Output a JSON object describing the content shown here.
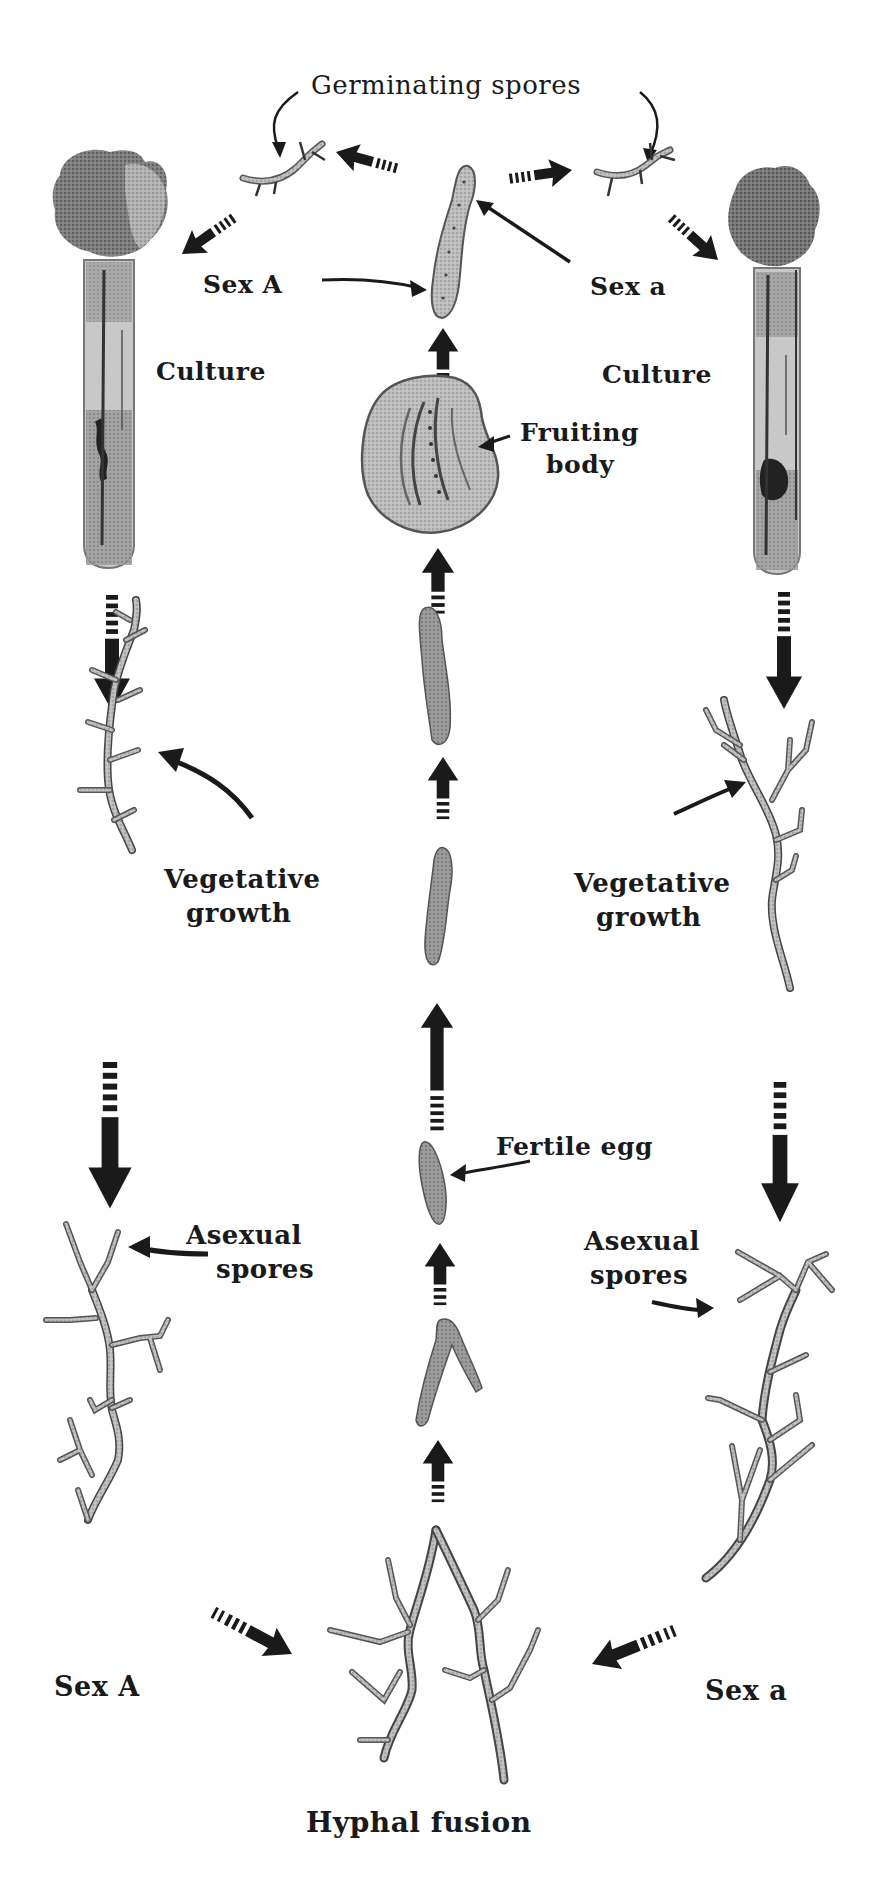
{
  "diagram": {
    "background": "#ffffff",
    "ink_color": "#1a1a1a",
    "tone_color": "#9a9a9a",
    "labels": {
      "germinating_spores": "Germinating spores",
      "sex_A_top": "Sex A",
      "sex_a_top": "Sex a",
      "culture_left": "Culture",
      "culture_right": "Culture",
      "fruiting_body_line1": "Fruiting",
      "fruiting_body_line2": "body",
      "vegetative_left_line1": "Vegetative",
      "vegetative_left_line2": "growth",
      "vegetative_right_line1": "Vegetative",
      "vegetative_right_line2": "growth",
      "fertile_egg": "Fertile egg",
      "asexual_left_line1": "Asexual",
      "asexual_left_line2": "spores",
      "asexual_right_line1": "Asexual",
      "asexual_right_line2": "spores",
      "sex_A_bottom": "Sex A",
      "sex_a_bottom": "Sex a",
      "hyphal_fusion": "Hyphal fusion"
    },
    "stages": [
      {
        "id": "culture-left",
        "name": "Culture (Sex A)"
      },
      {
        "id": "vegetative-left",
        "name": "Vegetative growth (Sex A)"
      },
      {
        "id": "asexual-left",
        "name": "Asexual spores (Sex A)"
      },
      {
        "id": "culture-right",
        "name": "Culture (Sex a)"
      },
      {
        "id": "vegetative-right",
        "name": "Vegetative growth (Sex a)"
      },
      {
        "id": "asexual-right",
        "name": "Asexual spores (Sex a)"
      },
      {
        "id": "hyphal-fusion",
        "name": "Hyphal fusion"
      },
      {
        "id": "fertile-egg",
        "name": "Fertile egg"
      },
      {
        "id": "fruiting-body",
        "name": "Fruiting body"
      },
      {
        "id": "germinating-spores",
        "name": "Germinating spores"
      }
    ]
  }
}
